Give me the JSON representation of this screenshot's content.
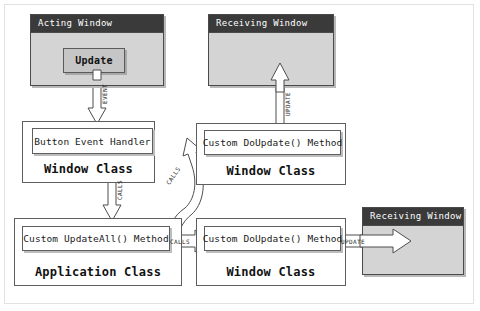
{
  "diagram": {
    "colors": {
      "titlebar": "#3a3a3a",
      "window_face": "#d4d4d4",
      "button_face": "#c6c6c6",
      "box_stroke": "#5e5e5e",
      "arrow_stroke": "#4d4d4d",
      "canvas": "#ffffff"
    }
  },
  "windows": {
    "acting": {
      "title": "Acting Window",
      "button_label": "Update"
    },
    "receiving_top": {
      "title": "Receiving Window"
    },
    "receiving_bottom": {
      "title": "Receiving Window"
    }
  },
  "classes": {
    "window_class_left": {
      "label": "Window Class",
      "method": "Button Event Handler"
    },
    "window_class_top_right": {
      "label": "Window Class",
      "method": "Custom DoUpdate() Method"
    },
    "application_class": {
      "label": "Application Class",
      "method": "Custom UpdateAll() Method"
    },
    "window_class_bottom_right": {
      "label": "Window Class",
      "method": "Custom DoUpdate() Method"
    }
  },
  "edges": {
    "event": "EVENT",
    "calls_handler_to_app": "CALLS",
    "calls_app_to_top_right": "CALLS",
    "calls_app_to_bottom_right": "CALLS",
    "update_top": "UPDATE",
    "update_bottom": "UPDATE"
  }
}
